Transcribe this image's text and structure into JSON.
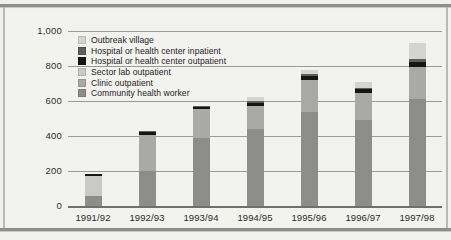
{
  "chart_data": {
    "type": "bar",
    "subtype": "stacked-bar",
    "title": "",
    "xlabel": "",
    "ylabel": "",
    "ylim": [
      0,
      1000
    ],
    "yticks": [
      0,
      200,
      400,
      600,
      800,
      1000
    ],
    "ytick_labels": [
      "0",
      "200",
      "400",
      "600",
      "800",
      "1,000"
    ],
    "grid": true,
    "legend_position": "top-left-inside",
    "categories": [
      "1991/92",
      "1992/93",
      "1993/94",
      "1994/95",
      "1995/96",
      "1996/97",
      "1997/98"
    ],
    "series": [
      {
        "name": "Community health worker",
        "color": "#8d8d8a",
        "values": [
          55,
          200,
          390,
          440,
          535,
          490,
          610
        ]
      },
      {
        "name": "Clinic outpatient",
        "color": "#a9a9a6",
        "values": [
          0,
          205,
          165,
          130,
          185,
          155,
          185
        ]
      },
      {
        "name": "Sector lab outpatient",
        "color": "#c9c9c6",
        "values": [
          115,
          0,
          0,
          0,
          0,
          0,
          0
        ]
      },
      {
        "name": "Hospital or health center outpatient",
        "color": "#151515",
        "values": [
          15,
          18,
          14,
          20,
          25,
          22,
          30
        ]
      },
      {
        "name": "Hospital or health center inpatient",
        "color": "#5e5e5c",
        "values": [
          0,
          5,
          5,
          10,
          10,
          10,
          15
        ]
      },
      {
        "name": "Outbreak village",
        "color": "#d4d4d1",
        "values": [
          0,
          0,
          0,
          25,
          20,
          30,
          90
        ]
      }
    ],
    "totals": [
      185,
      428,
      574,
      625,
      775,
      707,
      930
    ],
    "annotations": []
  },
  "legend": {
    "items": [
      {
        "label": "Outbreak village",
        "color": "#d4d4d1"
      },
      {
        "label": "Hospital or health center inpatient",
        "color": "#5e5e5c"
      },
      {
        "label": "Hospital or health center outpatient",
        "color": "#151515"
      },
      {
        "label": "Sector lab outpatient",
        "color": "#c9c9c6"
      },
      {
        "label": "Clinic outpatient",
        "color": "#a9a9a6"
      },
      {
        "label": "Community health worker",
        "color": "#8d8d8a"
      }
    ]
  }
}
